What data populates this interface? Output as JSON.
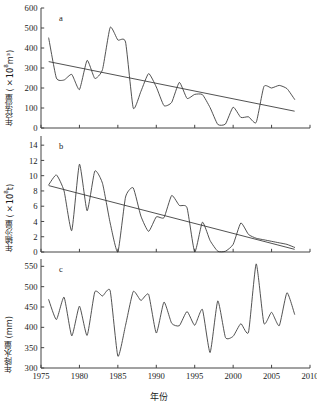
{
  "figure": {
    "xlabel": "年份",
    "x_ticks": [
      1975,
      1980,
      1985,
      1990,
      1995,
      2000,
      2005,
      2010
    ],
    "x_range": [
      1975,
      2010
    ]
  },
  "panels": {
    "a": {
      "letter": "a",
      "ylabel_main": "年径流量 (×10",
      "ylabel_sup": "8",
      "ylabel_tail": "m³)",
      "y_ticks": [
        0,
        100,
        200,
        300,
        400,
        500,
        600
      ],
      "y_range": [
        0,
        600
      ]
    },
    "b": {
      "letter": "b",
      "ylabel_main": "年输沙量 (×10",
      "ylabel_sup": "8",
      "ylabel_tail": "t)",
      "y_ticks": [
        0,
        2,
        4,
        6,
        8,
        10,
        12,
        14
      ],
      "y_range": [
        0,
        15.2
      ]
    },
    "c": {
      "letter": "c",
      "ylabel_main": "年降水量 (mm)",
      "ylabel_sup": "",
      "ylabel_tail": "",
      "y_ticks": [
        300,
        350,
        400,
        450,
        500,
        550
      ],
      "y_range": [
        300,
        568
      ]
    }
  },
  "chart_data": [
    {
      "type": "line",
      "panel": "a",
      "title": "",
      "xlabel": "年份",
      "ylabel": "年径流量 (×10^8 m³)",
      "xlim": [
        1975,
        2010
      ],
      "ylim": [
        0,
        600
      ],
      "grid": false,
      "legend": null,
      "annotations": [
        "a"
      ],
      "x": [
        1976,
        1977,
        1978,
        1979,
        1980,
        1981,
        1982,
        1983,
        1984,
        1985,
        1986,
        1987,
        1988,
        1989,
        1990,
        1991,
        1992,
        1993,
        1994,
        1995,
        1996,
        1997,
        1998,
        1999,
        2000,
        2001,
        2002,
        2003,
        2004,
        2005,
        2006,
        2007,
        2008
      ],
      "series": [
        {
          "name": "年径流量",
          "values": [
            450,
            250,
            240,
            268,
            192,
            338,
            248,
            292,
            503,
            440,
            430,
            100,
            183,
            272,
            205,
            112,
            128,
            228,
            148,
            168,
            167,
            102,
            18,
            20,
            104,
            53,
            56,
            28,
            207,
            200,
            213,
            197,
            143
          ]
        }
      ],
      "trend": {
        "name": "线性趋势",
        "x": [
          1976,
          2008
        ],
        "y": [
          332,
          84
        ]
      }
    },
    {
      "type": "line",
      "panel": "b",
      "title": "",
      "xlabel": "年份",
      "ylabel": "年输沙量 (×10^8 t)",
      "xlim": [
        1975,
        2010
      ],
      "ylim": [
        0,
        15.2
      ],
      "grid": false,
      "legend": null,
      "annotations": [
        "b"
      ],
      "x": [
        1976,
        1977,
        1978,
        1979,
        1980,
        1981,
        1982,
        1983,
        1984,
        1985,
        1986,
        1987,
        1988,
        1989,
        1990,
        1991,
        1992,
        1993,
        1994,
        1995,
        1996,
        1997,
        1998,
        1999,
        2000,
        2001,
        2002,
        2003,
        2004,
        2005,
        2006,
        2007,
        2008
      ],
      "series": [
        {
          "name": "年输沙量",
          "values": [
            8.8,
            10.1,
            8.0,
            2.8,
            11.5,
            5.4,
            10.6,
            9.0,
            3.8,
            0.0,
            7.2,
            8.4,
            4.7,
            2.7,
            4.6,
            4.5,
            7.4,
            6.1,
            5.8,
            0.0,
            3.9,
            1.5,
            0.1,
            0.1,
            1.0,
            3.8,
            2.3,
            1.8,
            1.6,
            1.4,
            1.2,
            1.0,
            0.6
          ]
        }
      ],
      "trend": {
        "name": "线性趋势",
        "x": [
          1976,
          2008
        ],
        "y": [
          8.7,
          0.35
        ]
      }
    },
    {
      "type": "line",
      "panel": "c",
      "title": "",
      "xlabel": "年份",
      "ylabel": "年降水量 (mm)",
      "xlim": [
        1975,
        2010
      ],
      "ylim": [
        300,
        568
      ],
      "grid": false,
      "legend": null,
      "annotations": [
        "c"
      ],
      "x": [
        1976,
        1977,
        1978,
        1979,
        1980,
        1981,
        1982,
        1983,
        1984,
        1985,
        1986,
        1987,
        1988,
        1989,
        1990,
        1991,
        1992,
        1993,
        1994,
        1995,
        1996,
        1997,
        1998,
        1999,
        2000,
        2001,
        2002,
        2003,
        2004,
        2005,
        2006,
        2007,
        2008
      ],
      "series": [
        {
          "name": "年降水量",
          "values": [
            468,
            419,
            474,
            379,
            452,
            380,
            487,
            477,
            490,
            329,
            405,
            488,
            466,
            481,
            386,
            462,
            410,
            404,
            439,
            405,
            444,
            338,
            465,
            375,
            378,
            409,
            388,
            556,
            410,
            437,
            404,
            485,
            432
          ]
        }
      ],
      "trend": null
    }
  ]
}
